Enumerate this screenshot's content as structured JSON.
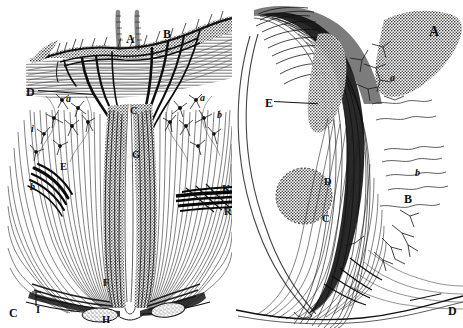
{
  "figure": {
    "background_color": "#ffffff",
    "ink_color": "#101010",
    "width": 463,
    "height": 328
  },
  "panels": [
    {
      "id": "left",
      "name": "left-panel",
      "description": "Symmetric midline section with central fissure, dense radiating fiber bundles and branching dendritic arbors",
      "labels": [
        {
          "text": "A",
          "x": 126,
          "y": 33,
          "style": "cap"
        },
        {
          "text": "B",
          "x": 163,
          "y": 28,
          "style": "cap"
        },
        {
          "text": "D",
          "x": 26,
          "y": 86,
          "style": "cap",
          "leader": {
            "x2": 92,
            "y2": 93
          }
        },
        {
          "text": "C",
          "x": 130,
          "y": 106,
          "style": "cap-sm"
        },
        {
          "text": "G",
          "x": 132,
          "y": 150,
          "style": "cap-sm"
        },
        {
          "text": "a",
          "x": 66,
          "y": 94,
          "style": "low"
        },
        {
          "text": "a",
          "x": 200,
          "y": 93,
          "style": "low"
        },
        {
          "text": "b",
          "x": 217,
          "y": 110,
          "style": "low"
        },
        {
          "text": "i",
          "x": 31,
          "y": 124,
          "style": "low"
        },
        {
          "text": "E",
          "x": 60,
          "y": 162,
          "style": "cap-sm"
        },
        {
          "text": "b",
          "x": 30,
          "y": 182,
          "style": "low"
        },
        {
          "text": "K",
          "x": 222,
          "y": 184,
          "style": "cap-sm"
        },
        {
          "text": "R",
          "x": 224,
          "y": 207,
          "style": "cap-sm"
        },
        {
          "text": "F",
          "x": 103,
          "y": 278,
          "style": "cap-sm"
        },
        {
          "text": "C",
          "x": 9,
          "y": 307,
          "style": "cap"
        },
        {
          "text": "I",
          "x": 36,
          "y": 305,
          "style": "cap-sm"
        },
        {
          "text": "H",
          "x": 102,
          "y": 315,
          "style": "cap-sm"
        }
      ]
    },
    {
      "id": "right",
      "name": "right-panel",
      "description": "Curved hook-shaped fiber tract sweeping from upper left to lower right with granular cell clusters and fine branching collaterals",
      "labels": [
        {
          "text": "A",
          "x": 429,
          "y": 25,
          "style": "big"
        },
        {
          "text": "a",
          "x": 390,
          "y": 73,
          "style": "low"
        },
        {
          "text": "E",
          "x": 265,
          "y": 97,
          "style": "cap",
          "leader": {
            "x2": 310,
            "y2": 100
          }
        },
        {
          "text": "D",
          "x": 324,
          "y": 177,
          "style": "cap-sm"
        },
        {
          "text": "b",
          "x": 415,
          "y": 168,
          "style": "low"
        },
        {
          "text": "B",
          "x": 404,
          "y": 193,
          "style": "cap"
        },
        {
          "text": "C",
          "x": 322,
          "y": 214,
          "style": "cap-sm"
        },
        {
          "text": "D",
          "x": 448,
          "y": 305,
          "style": "cap"
        }
      ]
    }
  ]
}
